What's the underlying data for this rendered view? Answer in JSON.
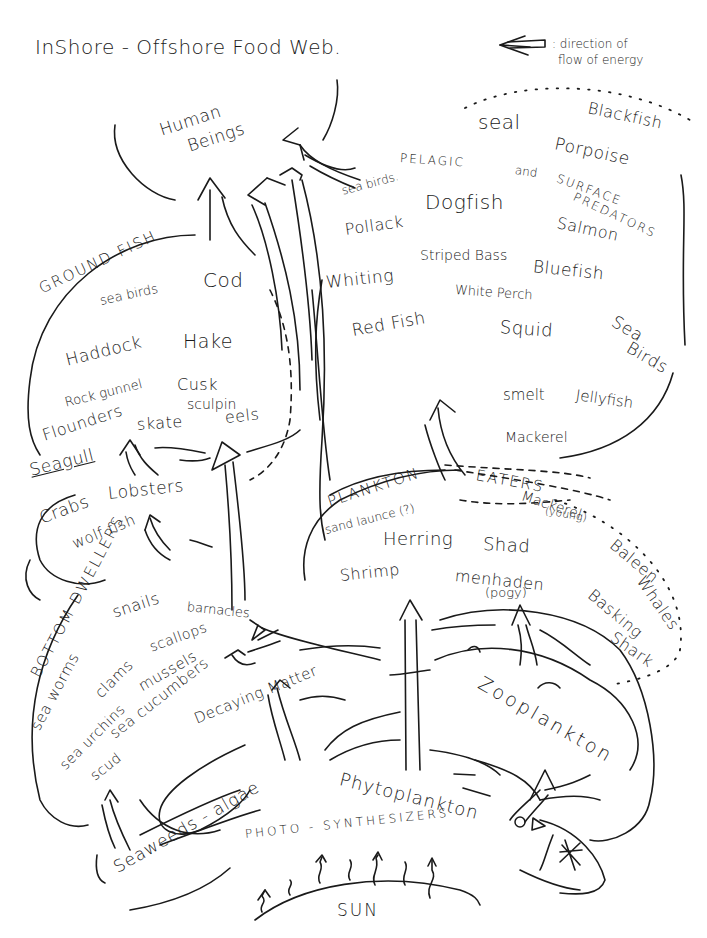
{
  "title": "InShore - Offshore Food Web.",
  "legend": {
    "arrow_icon": "hollow-left-arrow",
    "text_line1": ": direction of",
    "text_line2": "flow of energy"
  },
  "top": {
    "human_line1": "Human",
    "human_line2": "Beings"
  },
  "pelagic": {
    "group_label_1": "PELAGIC",
    "group_label_2": "and",
    "group_label_3": "SURFACE",
    "group_label_4": "PREDATORS",
    "items": {
      "seal": "seal",
      "blackfish": "Blackfish",
      "porpoise": "Porpoise",
      "sea_birds": "sea birds.",
      "dogfish": "Dogfish",
      "pollack": "Pollack",
      "salmon": "Salmon",
      "striped_bass": "Striped Bass",
      "bluefish": "Bluefish",
      "whiting": "Whiting",
      "white_perch": "White Perch",
      "red_fish": "Red Fish",
      "squid": "Squid",
      "sea_birds_2_line1": "Sea",
      "sea_birds_2_line2": "Birds",
      "smelt": "smelt",
      "jellyfish": "Jellyfish",
      "mackerel": "Mackerel"
    }
  },
  "ground_fish": {
    "group_label": "GROUND FISH",
    "items": {
      "sea_birds": "sea birds",
      "cod": "Cod",
      "haddock": "Haddock",
      "hake": "Hake",
      "rock_gunnel": "Rock gunnel",
      "cusk": "Cusk",
      "sculpin": "sculpin",
      "flounders": "Flounders",
      "skate": "skate",
      "eels": "eels",
      "seagull": "Seagull"
    }
  },
  "crustaceans": {
    "crabs": "Crabs",
    "lobsters": "Lobsters",
    "wolffish": "wolf fish"
  },
  "plankton_eaters": {
    "group_label_1": "PLANKTON",
    "group_label_2": "EATERS",
    "items": {
      "sand_launce": "sand launce (?)",
      "mackerel_young": "Mackerel",
      "mackerel_young_note": "(young)",
      "herring": "Herring",
      "shad": "Shad",
      "shrimp": "Shrimp",
      "menhaden": "menhaden",
      "menhaden_note": "(pogy)",
      "baleen_line1": "Baleen",
      "baleen_line2": "Whales",
      "basking_line1": "Basking",
      "basking_line2": "Shark"
    }
  },
  "bottom_dwellers": {
    "group_label": "BOTTOM DWELLERS",
    "items": {
      "snails": "snails",
      "barnacles": "barnacles",
      "sea_worms": "sea worms",
      "clams": "clams",
      "scallops": "scallops",
      "mussels": "mussels",
      "sea_urchins": "sea urchins",
      "sea_cucumbers": "sea cucumbers",
      "scud": "scud"
    }
  },
  "base": {
    "decaying_matter": "Decaying Matter",
    "zooplankton": "Zooplankton",
    "seaweeds": "Seaweeds - algae",
    "phytoplankton": "Phytoplankton",
    "photosynthesizers": "PHOTO - SYNTHESIZERS",
    "sun": "SUN"
  }
}
